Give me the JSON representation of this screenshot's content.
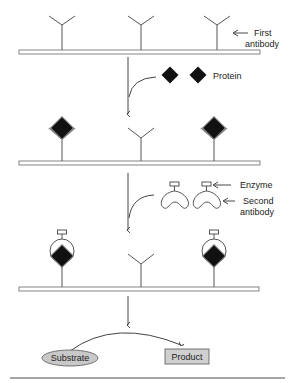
{
  "labels": {
    "first_antibody_line1": "First",
    "first_antibody_line2": "antibody",
    "protein": "Protein",
    "enzyme": "Enzyme",
    "second_antibody_line1": "Second",
    "second_antibody_line2": "antibody",
    "substrate": "Substrate",
    "product": "Product"
  },
  "colors": {
    "stroke": "#555555",
    "diamond": "#111111",
    "substrate_fill": "#c8c8c8",
    "product_fill": "#d0d0d0",
    "footer_line": "#888888"
  }
}
